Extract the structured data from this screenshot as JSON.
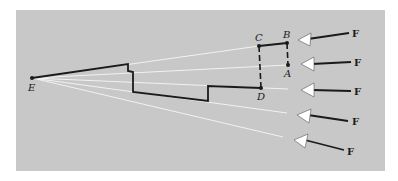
{
  "figure": {
    "type": "rigid-body force diagram",
    "background_color": "#c8c8c8",
    "line_color": "#1a1a1a",
    "ray_color": "#f2f2f2"
  },
  "points": {
    "E": {
      "label": "E",
      "x": 32,
      "y": 78
    },
    "C": {
      "label": "C",
      "x": 259,
      "y": 46
    },
    "B": {
      "label": "B",
      "x": 287,
      "y": 43
    },
    "A": {
      "label": "A",
      "x": 288,
      "y": 65
    },
    "D": {
      "label": "D",
      "x": 261,
      "y": 88
    }
  },
  "forces": [
    {
      "label": "F",
      "index": 1
    },
    {
      "label": "F",
      "index": 2
    },
    {
      "label": "F",
      "index": 3
    },
    {
      "label": "F",
      "index": 4
    },
    {
      "label": "F",
      "index": 5
    }
  ]
}
